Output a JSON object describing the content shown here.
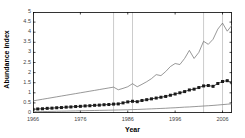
{
  "chart_data": {
    "type": "line",
    "title": "",
    "xlabel": "Year",
    "ylabel": "Abundance index",
    "xlim": [
      1966,
      2008
    ],
    "ylim": [
      0,
      5
    ],
    "grid": false,
    "legend": null,
    "x_ticks": [
      1966,
      1976,
      1986,
      1996,
      2006
    ],
    "y_ticks": [
      0,
      0.5,
      1,
      1.5,
      2,
      2.5,
      3,
      3.5,
      4,
      4.5,
      5
    ],
    "vertical_reference_lines": [
      1983,
      1987,
      2002,
      2006
    ],
    "x": [
      1966,
      1967,
      1968,
      1969,
      1970,
      1971,
      1972,
      1973,
      1974,
      1975,
      1976,
      1977,
      1978,
      1979,
      1980,
      1981,
      1982,
      1983,
      1984,
      1985,
      1986,
      1987,
      1988,
      1989,
      1990,
      1991,
      1992,
      1993,
      1994,
      1995,
      1996,
      1997,
      1998,
      1999,
      2000,
      2001,
      2002,
      2003,
      2004,
      2005,
      2006,
      2007,
      2008
    ],
    "series": [
      {
        "name": "upper confidence limit",
        "marker": "none",
        "color": "#6b6b6b",
        "values": [
          0.6,
          0.64,
          0.68,
          0.72,
          0.76,
          0.8,
          0.84,
          0.88,
          0.92,
          0.96,
          1.0,
          1.04,
          1.08,
          1.12,
          1.16,
          1.2,
          1.24,
          1.28,
          1.15,
          1.22,
          1.3,
          1.45,
          1.3,
          1.42,
          1.55,
          1.7,
          1.9,
          1.85,
          2.05,
          2.3,
          2.45,
          2.4,
          2.7,
          3.1,
          2.7,
          3.0,
          3.55,
          3.4,
          3.65,
          4.15,
          4.45,
          4.05,
          4.35
        ]
      },
      {
        "name": "abundance index",
        "marker": "square",
        "color": "#1a1a1a",
        "values": [
          0.18,
          0.2,
          0.21,
          0.23,
          0.24,
          0.26,
          0.27,
          0.29,
          0.3,
          0.32,
          0.33,
          0.35,
          0.36,
          0.38,
          0.39,
          0.41,
          0.42,
          0.44,
          0.45,
          0.5,
          0.55,
          0.58,
          0.56,
          0.62,
          0.66,
          0.7,
          0.74,
          0.78,
          0.82,
          0.88,
          0.94,
          1.0,
          1.06,
          1.14,
          1.18,
          1.26,
          1.34,
          1.36,
          1.32,
          1.46,
          1.56,
          1.6,
          1.5
        ]
      },
      {
        "name": "lower confidence limit",
        "marker": "none",
        "color": "#6b6b6b",
        "values": [
          0.06,
          0.065,
          0.07,
          0.075,
          0.08,
          0.085,
          0.09,
          0.095,
          0.1,
          0.105,
          0.11,
          0.115,
          0.12,
          0.125,
          0.13,
          0.135,
          0.14,
          0.145,
          0.15,
          0.155,
          0.16,
          0.17,
          0.175,
          0.185,
          0.195,
          0.205,
          0.215,
          0.225,
          0.235,
          0.25,
          0.26,
          0.275,
          0.29,
          0.3,
          0.315,
          0.33,
          0.345,
          0.36,
          0.375,
          0.395,
          0.415,
          0.435,
          0.455
        ]
      }
    ]
  },
  "axes": {
    "y_title": "Abundance index",
    "x_title": "Year",
    "y_tick_labels": [
      "5",
      "4.5",
      "4",
      "3.5",
      "3",
      "2.5",
      "2",
      "1.5",
      "1",
      "0.5",
      "0"
    ],
    "x_tick_labels": [
      "1966",
      "1976",
      "1986",
      "1996",
      "2006"
    ]
  },
  "colors": {
    "frame": "#000000",
    "line": "#6b6b6b",
    "marker_line": "#1a1a1a",
    "reference_line": "#bfbfbf",
    "background": "#ffffff"
  }
}
